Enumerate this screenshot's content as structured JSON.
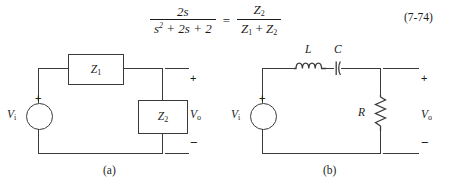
{
  "equation": {
    "lhs": {
      "numerator": "2s",
      "denominator": "s2 + 2s + 2",
      "den_base": "s",
      "den_exp": "2",
      "den_rest": " + 2s + 2"
    },
    "relation": "=",
    "rhs": {
      "numerator_base": "Z",
      "numerator_sub": "2",
      "denominator": "Z1 + Z2"
    },
    "number": "(7-74)"
  },
  "figure": {
    "circuit_a": {
      "caption": "(a)",
      "source_label": "V",
      "source_sub": "i",
      "source_plus": "+",
      "series_element": {
        "label": "Z",
        "sub": "1"
      },
      "shunt_element": {
        "label": "Z",
        "sub": "2"
      },
      "output_label": "V",
      "output_sub": "o",
      "terminal_plus": "+",
      "terminal_minus": "−"
    },
    "circuit_b": {
      "caption": "(b)",
      "source_label": "V",
      "source_sub": "i",
      "source_plus": "+",
      "inductor_label": "L",
      "capacitor_label": "C",
      "resistor_label": "R",
      "output_label": "V",
      "output_sub": "o",
      "terminal_plus": "+",
      "terminal_minus": "−"
    }
  },
  "colors": {
    "ink": "#1c1c1c",
    "wire": "#3a3a3a",
    "background": "#ffffff"
  }
}
